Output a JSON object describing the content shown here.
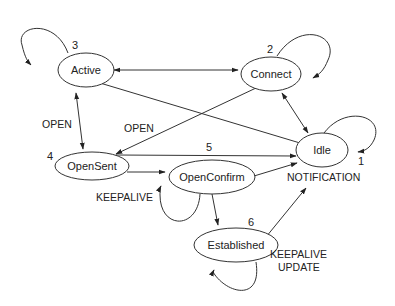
{
  "diagram": {
    "type": "state-machine",
    "nodes": [
      {
        "id": "active",
        "label": "Active",
        "number": "3"
      },
      {
        "id": "connect",
        "label": "Connect",
        "number": "2"
      },
      {
        "id": "idle",
        "label": "Idle",
        "number": "1"
      },
      {
        "id": "opensent",
        "label": "OpenSent",
        "number": "4"
      },
      {
        "id": "openconfirm",
        "label": "OpenConfirm",
        "number": "5"
      },
      {
        "id": "established",
        "label": "Established",
        "number": "6"
      }
    ],
    "edge_labels": {
      "active_opensent": "OPEN",
      "connect_opensent": "OPEN",
      "openconfirm_self": "KEEPALIVE",
      "to_idle": "NOTIFICATION",
      "established_self_1": "KEEPALIVE",
      "established_self_2": "UPDATE"
    },
    "edges": [
      {
        "from": "active",
        "to": "active",
        "kind": "self-loop"
      },
      {
        "from": "connect",
        "to": "connect",
        "kind": "self-loop"
      },
      {
        "from": "idle",
        "to": "idle",
        "kind": "self-loop"
      },
      {
        "from": "active",
        "to": "connect",
        "kind": "bidirectional"
      },
      {
        "from": "active",
        "to": "idle",
        "kind": "line"
      },
      {
        "from": "connect",
        "to": "idle",
        "kind": "bidirectional"
      },
      {
        "from": "active",
        "to": "opensent",
        "kind": "bidirectional",
        "label": "OPEN"
      },
      {
        "from": "connect",
        "to": "opensent",
        "kind": "directed",
        "label": "OPEN"
      },
      {
        "from": "opensent",
        "to": "idle",
        "kind": "directed"
      },
      {
        "from": "opensent",
        "to": "openconfirm",
        "kind": "directed"
      },
      {
        "from": "openconfirm",
        "to": "idle",
        "kind": "directed",
        "label": "NOTIFICATION"
      },
      {
        "from": "openconfirm",
        "to": "openconfirm",
        "kind": "self-loop",
        "label": "KEEPALIVE"
      },
      {
        "from": "openconfirm",
        "to": "established",
        "kind": "directed"
      },
      {
        "from": "established",
        "to": "idle",
        "kind": "directed"
      },
      {
        "from": "established",
        "to": "established",
        "kind": "self-loop",
        "label": "KEEPALIVE UPDATE"
      }
    ]
  }
}
